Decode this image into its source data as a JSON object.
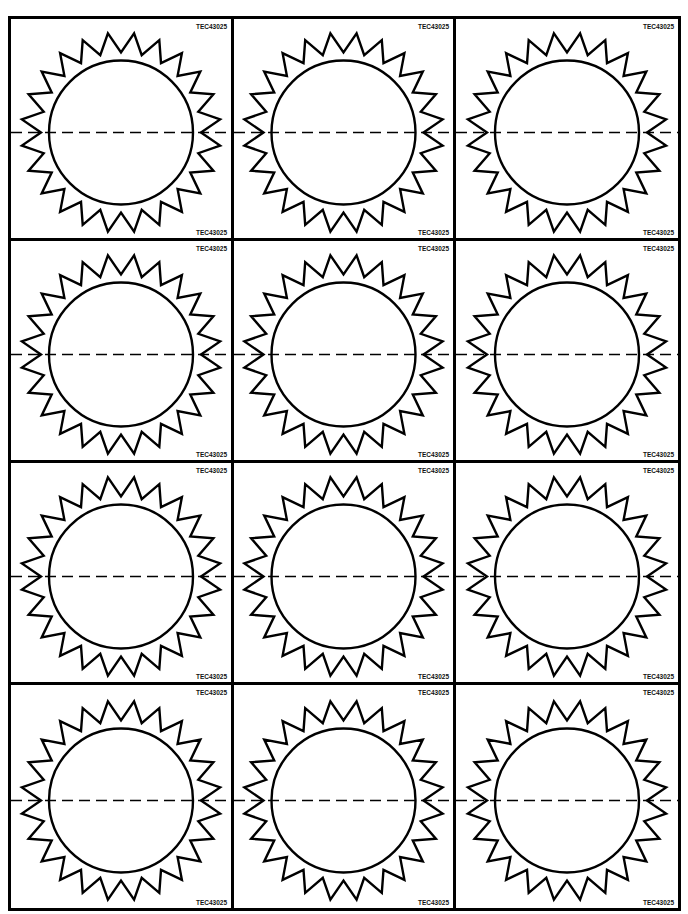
{
  "page": {
    "header_text_cut": "",
    "layout": {
      "rows": 4,
      "columns": 3
    },
    "cut_line": "dashed",
    "colors": {
      "ink": "#000000",
      "paper": "#ffffff"
    }
  },
  "cards": [
    {
      "code_top": "TEC43025",
      "code_bottom": "TEC43025",
      "shape": "sun-icon"
    },
    {
      "code_top": "TEC43025",
      "code_bottom": "TEC43025",
      "shape": "sun-icon"
    },
    {
      "code_top": "TEC43025",
      "code_bottom": "TEC43025",
      "shape": "sun-icon"
    },
    {
      "code_top": "TEC43025",
      "code_bottom": "TEC43025",
      "shape": "sun-icon"
    },
    {
      "code_top": "TEC43025",
      "code_bottom": "TEC43025",
      "shape": "sun-icon"
    },
    {
      "code_top": "TEC43025",
      "code_bottom": "TEC43025",
      "shape": "sun-icon"
    },
    {
      "code_top": "TEC43025",
      "code_bottom": "TEC43025",
      "shape": "sun-icon"
    },
    {
      "code_top": "TEC43025",
      "code_bottom": "TEC43025",
      "shape": "sun-icon"
    },
    {
      "code_top": "TEC43025",
      "code_bottom": "TEC43025",
      "shape": "sun-icon"
    },
    {
      "code_top": "TEC43025",
      "code_bottom": "TEC43025",
      "shape": "sun-icon"
    },
    {
      "code_top": "TEC43025",
      "code_bottom": "TEC43025",
      "shape": "sun-icon"
    },
    {
      "code_top": "TEC43025",
      "code_bottom": "TEC43025",
      "shape": "sun-icon"
    }
  ]
}
